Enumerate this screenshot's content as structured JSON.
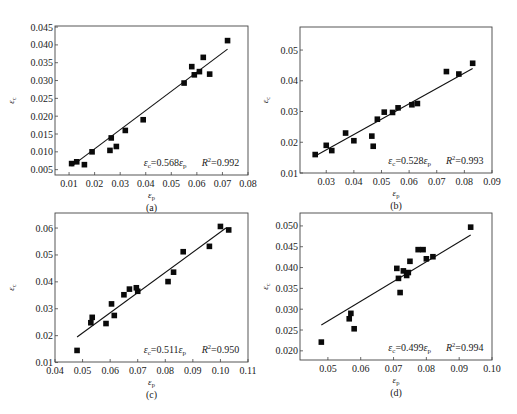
{
  "figure": {
    "panels": [
      "(a)",
      "(b)",
      "(c)",
      "(d)"
    ]
  },
  "chart_data": [
    {
      "id": "a",
      "type": "scatter",
      "caption": "(a)",
      "xlabel": "ε_p",
      "ylabel": "ε_c",
      "xlim": [
        0.0045,
        0.08
      ],
      "ylim": [
        0.0035,
        0.0453
      ],
      "xticks": [
        0.01,
        0.02,
        0.03,
        0.04,
        0.05,
        0.06,
        0.07,
        0.08
      ],
      "xtick_labels": [
        "0.01",
        "0.02",
        "0.03",
        "0.04",
        "0.05",
        "0.06",
        "0.07",
        "0.08"
      ],
      "yticks": [
        0.005,
        0.01,
        0.015,
        0.02,
        0.025,
        0.03,
        0.035,
        0.04,
        0.045
      ],
      "ytick_labels": [
        "0.005",
        "0.010",
        "0.015",
        "0.020",
        "0.025",
        "0.030",
        "0.035",
        "0.040",
        "0.045"
      ],
      "grid": false,
      "points": [
        [
          0.011,
          0.0067
        ],
        [
          0.013,
          0.0072
        ],
        [
          0.016,
          0.0064
        ],
        [
          0.019,
          0.01
        ],
        [
          0.026,
          0.0104
        ],
        [
          0.0265,
          0.0139
        ],
        [
          0.0285,
          0.0115
        ],
        [
          0.032,
          0.016
        ],
        [
          0.039,
          0.019
        ],
        [
          0.055,
          0.0293
        ],
        [
          0.058,
          0.0339
        ],
        [
          0.059,
          0.0316
        ],
        [
          0.061,
          0.0325
        ],
        [
          0.0625,
          0.0365
        ],
        [
          0.065,
          0.0318
        ],
        [
          0.072,
          0.0412
        ]
      ],
      "fit": {
        "slope": 0.568,
        "x_range": [
          0.011,
          0.072
        ],
        "y_range": [
          0.006,
          0.0388
        ]
      },
      "equation": {
        "lhs": "ε",
        "lhs_sub": "c",
        "rhs": "=0.568ε",
        "rhs_sub": "p"
      },
      "r2": {
        "label": "R",
        "sup": "2",
        "value": "=0.992"
      }
    },
    {
      "id": "b",
      "type": "scatter",
      "caption": "(b)",
      "xlabel": "ε_p",
      "ylabel": "ε_c",
      "xlim": [
        0.0205,
        0.09
      ],
      "ylim": [
        0.01,
        0.0575
      ],
      "xticks": [
        0.03,
        0.04,
        0.05,
        0.06,
        0.07,
        0.08,
        0.09
      ],
      "xtick_labels": [
        "0.03",
        "0.04",
        "0.05",
        "0.06",
        "0.07",
        "0.08",
        "0.09"
      ],
      "yticks": [
        0.01,
        0.02,
        0.03,
        0.04,
        0.05
      ],
      "ytick_labels": [
        "0.01",
        "0.02",
        "0.03",
        "0.04",
        "0.05"
      ],
      "grid": false,
      "points": [
        [
          0.026,
          0.016
        ],
        [
          0.03,
          0.019
        ],
        [
          0.032,
          0.0173
        ],
        [
          0.037,
          0.023
        ],
        [
          0.04,
          0.0205
        ],
        [
          0.0465,
          0.022
        ],
        [
          0.047,
          0.0187
        ],
        [
          0.0485,
          0.0275
        ],
        [
          0.051,
          0.0298
        ],
        [
          0.054,
          0.0297
        ],
        [
          0.056,
          0.0312
        ],
        [
          0.061,
          0.0322
        ],
        [
          0.063,
          0.0326
        ],
        [
          0.0735,
          0.043
        ],
        [
          0.078,
          0.0422
        ],
        [
          0.083,
          0.0457
        ]
      ],
      "fit": {
        "slope": 0.528,
        "x_range": [
          0.026,
          0.083
        ],
        "y_range": [
          0.0155,
          0.044
        ]
      },
      "equation": {
        "lhs": "ε",
        "lhs_sub": "c",
        "rhs": "=0.528ε",
        "rhs_sub": "p"
      },
      "r2": {
        "label": "R",
        "sup": "2",
        "value": "=0.993"
      }
    },
    {
      "id": "c",
      "type": "scatter",
      "caption": "(c)",
      "xlabel": "ε_p",
      "ylabel": "ε_c",
      "xlim": [
        0.04,
        0.11
      ],
      "ylim": [
        0.0102,
        0.0656
      ],
      "xticks": [
        0.04,
        0.05,
        0.06,
        0.07,
        0.08,
        0.09,
        0.1,
        0.11
      ],
      "xtick_labels": [
        "0.04",
        "0.05",
        "0.06",
        "0.07",
        "0.08",
        "0.09",
        "0.10",
        "0.11"
      ],
      "yticks": [
        0.01,
        0.02,
        0.03,
        0.04,
        0.05,
        0.06
      ],
      "ytick_labels": [
        "0.01",
        "0.02",
        "0.03",
        "0.04",
        "0.05",
        "0.06"
      ],
      "grid": false,
      "points": [
        [
          0.048,
          0.0145
        ],
        [
          0.053,
          0.0248
        ],
        [
          0.0535,
          0.0268
        ],
        [
          0.0585,
          0.0245
        ],
        [
          0.0605,
          0.0318
        ],
        [
          0.0615,
          0.0275
        ],
        [
          0.065,
          0.0352
        ],
        [
          0.067,
          0.0373
        ],
        [
          0.0695,
          0.0378
        ],
        [
          0.07,
          0.0365
        ],
        [
          0.081,
          0.0401
        ],
        [
          0.083,
          0.0436
        ],
        [
          0.0865,
          0.0512
        ],
        [
          0.096,
          0.0532
        ],
        [
          0.1,
          0.0606
        ],
        [
          0.103,
          0.0593
        ]
      ],
      "fit": {
        "slope": 0.511,
        "x_range": [
          0.048,
          0.102
        ],
        "y_range": [
          0.0195,
          0.06
        ]
      },
      "equation": {
        "lhs": "ε",
        "lhs_sub": "c",
        "rhs": "=0.511ε",
        "rhs_sub": "p"
      },
      "r2": {
        "label": "R",
        "sup": "2",
        "value": "=0.950"
      }
    },
    {
      "id": "d",
      "type": "scatter",
      "caption": "(d)",
      "xlabel": "ε_p",
      "ylabel": "ε_c",
      "xlim": [
        0.0415,
        0.1
      ],
      "ylim": [
        0.0178,
        0.0531
      ],
      "xticks": [
        0.05,
        0.06,
        0.07,
        0.08,
        0.09,
        0.1
      ],
      "xtick_labels": [
        "0.05",
        "0.06",
        "0.07",
        "0.08",
        "0.09",
        "0.10"
      ],
      "yticks": [
        0.02,
        0.025,
        0.03,
        0.035,
        0.04,
        0.045,
        0.05
      ],
      "ytick_labels": [
        "0.020",
        "0.025",
        "0.030",
        "0.035",
        "0.040",
        "0.045",
        "0.050"
      ],
      "grid": false,
      "points": [
        [
          0.048,
          0.0221
        ],
        [
          0.0565,
          0.0277
        ],
        [
          0.057,
          0.029
        ],
        [
          0.058,
          0.0253
        ],
        [
          0.071,
          0.0398
        ],
        [
          0.0715,
          0.0374
        ],
        [
          0.072,
          0.034
        ],
        [
          0.073,
          0.0392
        ],
        [
          0.074,
          0.0381
        ],
        [
          0.0745,
          0.0388
        ],
        [
          0.075,
          0.0415
        ],
        [
          0.0775,
          0.0443
        ],
        [
          0.079,
          0.0443
        ],
        [
          0.08,
          0.0421
        ],
        [
          0.082,
          0.0426
        ],
        [
          0.0935,
          0.0497
        ]
      ],
      "fit": {
        "slope": 0.499,
        "x_range": [
          0.048,
          0.0935
        ],
        "y_range": [
          0.0262,
          0.0478
        ]
      },
      "equation": {
        "lhs": "ε",
        "lhs_sub": "c",
        "rhs": "=0.499ε",
        "rhs_sub": "p"
      },
      "r2": {
        "label": "R",
        "sup": "2",
        "value": "=0.994"
      }
    }
  ],
  "layout": {
    "frames": [
      {
        "left": 55,
        "top": 26,
        "right": 248,
        "bottom": 175
      },
      {
        "left": 300,
        "top": 27,
        "right": 492,
        "bottom": 173
      },
      {
        "left": 55,
        "top": 213,
        "right": 248,
        "bottom": 362
      },
      {
        "left": 300,
        "top": 213,
        "right": 492,
        "bottom": 360
      }
    ]
  }
}
